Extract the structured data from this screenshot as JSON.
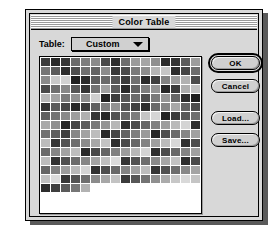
{
  "window": {
    "title": "Color Table"
  },
  "table_selector": {
    "label": "Table:",
    "value": "Custom",
    "arrow_icon": "chevron-down-icon",
    "options": [
      "Custom"
    ]
  },
  "buttons": {
    "ok": "OK",
    "cancel": "Cancel",
    "load": "Load...",
    "save": "Save..."
  },
  "colors": {
    "window_bg": "#d8d8d8",
    "well_bg": "#ffffff",
    "border": "#000000",
    "button_face": "#d0d0d0"
  },
  "swatch_grid": {
    "columns": 16,
    "rows": 15,
    "total_swatches": 231,
    "cells": [
      "#3c3c3c",
      "#2a2a2a",
      "#353535",
      "#6b6b6b",
      "#7d7d7d",
      "#8a8a8a",
      "#4a4a4a",
      "#2f2f2f",
      "#6e6e6e",
      "#9b9b9b",
      "#a5a5a5",
      "#8f8f8f",
      "#2b2b2b",
      "#343434",
      "#5c5c5c",
      "#9d9d9d",
      "#767676",
      "#5a5a5a",
      "#2d2d2d",
      "#4e4e4e",
      "#707070",
      "#646464",
      "#8c8c8c",
      "#3a3a3a",
      "#4c4c4c",
      "#7b7b7b",
      "#8e8e8e",
      "#b4b4b4",
      "#c6c6c6",
      "#2e2e2e",
      "#454545",
      "#6d6d6d",
      "#8b8b8b",
      "#c9c9c9",
      "#d2d2d2",
      "#1f1f1f",
      "#2c2c2c",
      "#5e5e5e",
      "#6a6a6a",
      "#565656",
      "#3d3d3d",
      "#717171",
      "#2a2a2a",
      "#3f3f3f",
      "#828282",
      "#9c9c9c",
      "#b1b1b1",
      "#4b4b4b",
      "#4a4a4a",
      "#6f6f6f",
      "#888888",
      "#555555",
      "#343434",
      "#737373",
      "#a0a0a0",
      "#5d5d5d",
      "#2b2b2b",
      "#626262",
      "#7e7e7e",
      "#939393",
      "#262626",
      "#3b3b3b",
      "#aeaeae",
      "#c1c1c1",
      "#b8b8b8",
      "#a3a3a3",
      "#7c7c7c",
      "#909090",
      "#8d8d8d",
      "#cfcfcf",
      "#212121",
      "#3e3e3e",
      "#575757",
      "#6c6c6c",
      "#4f4f4f",
      "#7a7a7a",
      "#959595",
      "#686868",
      "#2d2d2d",
      "#1e1e1e",
      "#333333",
      "#5b5b5b",
      "#474747",
      "#292929",
      "#3a3a3a",
      "#616161",
      "#7f7f7f",
      "#929292",
      "#545454",
      "#404040",
      "#2c2c2c",
      "#696969",
      "#858585",
      "#a8a8a8",
      "#636363",
      "#4d4d4d",
      "#5f5f5f",
      "#747474",
      "#898989",
      "#9e9e9e",
      "#b0b0b0",
      "#353535",
      "#282828",
      "#515151",
      "#676767",
      "#7d7d7d",
      "#c4c4c4",
      "#d6d6d6",
      "#232323",
      "#3c3c3c",
      "#585858",
      "#6e6e6e",
      "#a9a9a9",
      "#8f8f8f",
      "#262626",
      "#444444",
      "#5c5c5c",
      "#787878",
      "#949494",
      "#b6b6b6",
      "#2f2f2f",
      "#4a4a4a",
      "#666666",
      "#818181",
      "#9d9d9d",
      "#b9b9b9",
      "#d4d4d4",
      "#313131",
      "#727272",
      "#5e5e5e",
      "#3f3f3f",
      "#878787",
      "#a2a2a2",
      "#bdbdbd",
      "#2a2a2a",
      "#464646",
      "#626262",
      "#7e7e7e",
      "#9a9a9a",
      "#252525",
      "#505050",
      "#6b6b6b",
      "#868686",
      "#a1a1a1",
      "#bcbcbc",
      "#373737",
      "#535353",
      "#6f6f6f",
      "#8b8b8b",
      "#a7a7a7",
      "#c3c3c3",
      "#2e2e2e",
      "#4b4b4b",
      "#676767",
      "#838383",
      "#9f9f9f",
      "#bbbbbb",
      "#d7d7d7",
      "#323232",
      "#4e4e4e",
      "#6a6a6a",
      "#868686",
      "#a2a2a2",
      "#bebebe",
      "#2b2b2b",
      "#484848",
      "#646464",
      "#808080",
      "#9c9c9c",
      "#b8b8b8",
      "#d4d4d4",
      "#2f2f2f",
      "#4c4c4c",
      "#686868",
      "#848484",
      "#a0a0a0",
      "#bcbcbc",
      "#333333",
      "#4f4f4f",
      "#6b6b6b",
      "#878787",
      "#a3a3a3",
      "#bfbfbf",
      "#dbdbdb",
      "#363636",
      "#525252",
      "#6e6e6e",
      "#8a8a8a",
      "#a6a6a6",
      "#c2c2c2",
      "#2d2d2d",
      "#494949",
      "#656565",
      "#818181",
      "#9d9d9d",
      "#b9b9b9",
      "#d5d5d5",
      "#303030",
      "#4d4d4d",
      "#696969",
      "#858585",
      "#a1a1a1",
      "#bdbdbd",
      "#343434",
      "#505050",
      "#6c6c6c",
      "#888888",
      "#a4a4a4",
      "#c0c0c0",
      "#dcdcdc",
      "#373737",
      "#535353",
      "#6f6f6f",
      "#8b8b8b",
      "#a7a7a7",
      "#c3c3c3",
      "#3b3b3b",
      "#575757",
      "#737373",
      "#8f8f8f",
      "#ababab",
      "#c7c7c7",
      "#d9d9d9",
      "#c5c5c5",
      "#2c2c2c",
      "#3e3e3e",
      "#5a5a5a",
      "#767676",
      "#b2b2b2"
    ]
  }
}
